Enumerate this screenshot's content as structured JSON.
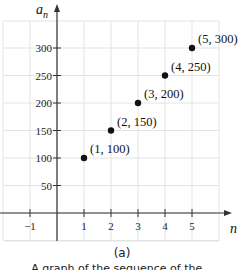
{
  "chart_data": {
    "type": "scatter",
    "title": "",
    "xlabel": "n",
    "ylabel": "a_n",
    "x": [
      1,
      2,
      3,
      4,
      5
    ],
    "values": [
      100,
      150,
      200,
      250,
      300
    ],
    "point_labels": [
      "(1, 100)",
      "(2, 150)",
      "(3, 200)",
      "(4, 250)",
      "(5, 300)"
    ],
    "x_ticks": [
      -1,
      1,
      2,
      3,
      4,
      5
    ],
    "y_ticks": [
      50,
      100,
      150,
      200,
      250,
      300
    ],
    "xlim": [
      -2,
      6
    ],
    "ylim": [
      -50,
      350
    ],
    "grid": true,
    "legend": null
  },
  "axes": {
    "x_label": "n",
    "y_label_base": "a",
    "y_label_sub": "n"
  },
  "caption": {
    "letter": "(a)",
    "text": "A graph of the sequence of the..."
  },
  "colors": {
    "grid": "#e3e3e3",
    "axis": "#333333",
    "point": "#111111"
  }
}
